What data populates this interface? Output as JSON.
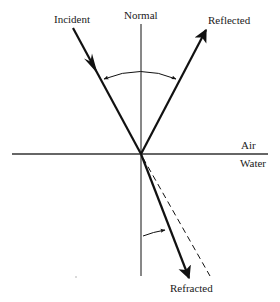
{
  "diagram": {
    "labels": {
      "incident": "Incident",
      "normal": "Normal",
      "reflected": "Reflected",
      "air": "Air",
      "water": "Water",
      "refracted": "Refracted"
    },
    "colors": {
      "ink": "#111111",
      "interface": "#333333",
      "background": "#ffffff"
    },
    "elements": [
      {
        "id": "normal-line",
        "type": "line",
        "style": "thin solid"
      },
      {
        "id": "interface-line",
        "type": "line",
        "style": "medium solid"
      },
      {
        "id": "incident-ray",
        "type": "arrow",
        "style": "thick solid",
        "direction": "toward interface"
      },
      {
        "id": "reflected-ray",
        "type": "arrow",
        "style": "thick solid",
        "direction": "away from interface"
      },
      {
        "id": "refracted-ray",
        "type": "arrow",
        "style": "thick solid",
        "direction": "away from interface"
      },
      {
        "id": "undeviated-path",
        "type": "line",
        "style": "dashed"
      },
      {
        "id": "reflection-angle-arc",
        "type": "double-arrow-arc"
      },
      {
        "id": "refraction-angle-arc",
        "type": "arrow-arc"
      }
    ]
  }
}
